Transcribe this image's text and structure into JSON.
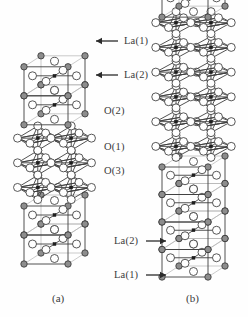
{
  "figure": {
    "type": "crystal-structure-diagram",
    "background_color": "#fefefe",
    "panels": [
      {
        "id": "a",
        "caption": "(a)",
        "caption_x": 52,
        "caption_y": 293,
        "column_x": 18,
        "column_y": 28,
        "column_width": 72,
        "column_height": 244,
        "labels": [
          {
            "text": "La(1)",
            "x": 124,
            "y": 36,
            "arrow": "left",
            "arrow_x1": 118,
            "arrow_x2": 96,
            "arrow_y": 41
          },
          {
            "text": "La(2)",
            "x": 124,
            "y": 70,
            "arrow": "left",
            "arrow_x1": 118,
            "arrow_x2": 96,
            "arrow_y": 75
          },
          {
            "text": "O(2)",
            "x": 104,
            "y": 106,
            "arrow": "none"
          },
          {
            "text": "O(1)",
            "x": 104,
            "y": 142,
            "arrow": "none"
          },
          {
            "text": "O(3)",
            "x": 104,
            "y": 166,
            "arrow": "none"
          }
        ]
      },
      {
        "id": "b",
        "caption": "(b)",
        "caption_x": 186,
        "caption_y": 293,
        "column_x": 156,
        "column_y": 12,
        "column_width": 74,
        "column_height": 273,
        "labels": [
          {
            "text": "La(2)",
            "x": 114,
            "y": 236,
            "arrow": "right",
            "arrow_x1": 146,
            "arrow_x2": 166,
            "arrow_y": 241
          },
          {
            "text": "La(1)",
            "x": 114,
            "y": 270,
            "arrow": "right",
            "arrow_x1": 146,
            "arrow_x2": 166,
            "arrow_y": 275
          }
        ]
      }
    ],
    "atom_types": [
      {
        "name": "La",
        "style": "gray-filled-circle",
        "color": "#8d8d8d",
        "stroke": "#3a3a3a",
        "radius": 3.2
      },
      {
        "name": "O",
        "style": "white-open-circle",
        "color": "#ffffff",
        "stroke": "#3a3a3a",
        "radius": 4.0
      },
      {
        "name": "M",
        "style": "small-black-square",
        "color": "#1e1e1e",
        "stroke": "#1e1e1e",
        "radius": 1.9
      }
    ],
    "bond_color": "#3f3f3f",
    "cell_edge_color": "#4a4a4a",
    "hidden_edge_color": "#b5b5b5"
  }
}
